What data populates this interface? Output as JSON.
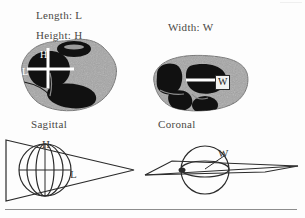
{
  "figure": {
    "background_color": "#fdfdfd",
    "tissue_fill_color": "#a6a6a6",
    "lesion_fill_color": "#111111",
    "measure_line_color": "#ffffff",
    "line_color": "#2b2b2b"
  },
  "labels": {
    "length": "Length: L",
    "height": "Height: H",
    "width": "Width: W",
    "sagittal": "Sagittal",
    "coronal": "Coronal"
  },
  "annotations": {
    "axial_height": "H",
    "axial_length": "L",
    "coronal_width": "W",
    "cone_height": "H",
    "cone_length": "L",
    "cone_width": "W"
  },
  "panels": [
    {
      "id": "axial-specimen",
      "view": "sagittal",
      "caption": "Sagittal",
      "measures": [
        "H",
        "L"
      ],
      "description": "Gray tissue section with dark lesions, white crosshair marking height and length"
    },
    {
      "id": "coronal-specimen",
      "view": "coronal",
      "caption": "Coronal",
      "measures": [
        "W"
      ],
      "description": "Gray tissue section with dark lesions, white horizontal line marking width"
    },
    {
      "id": "sagittal-schematic",
      "view": "sagittal",
      "measures": [
        "H",
        "L"
      ],
      "description": "Cone outline enclosing a sphere; vertical axis H and horizontal axis L"
    },
    {
      "id": "coronal-schematic",
      "view": "coronal",
      "measures": [
        "W"
      ],
      "description": "Flattened wedge plane intersecting a circle; radius labelled W"
    }
  ]
}
